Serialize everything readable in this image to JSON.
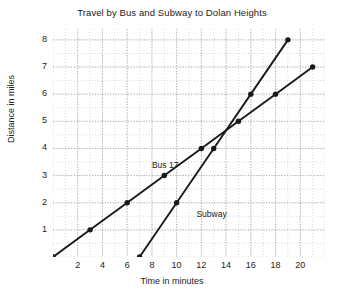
{
  "chart_data": {
    "type": "line",
    "title": "Travel by Bus and Subway to Dolan Heights",
    "xlabel": "Time in minutes",
    "ylabel": "Distance in miles",
    "xlim": [
      0,
      22
    ],
    "ylim": [
      0,
      8.4
    ],
    "xticks": [
      2,
      4,
      6,
      8,
      10,
      12,
      14,
      16,
      18,
      20
    ],
    "yticks": [
      1,
      2,
      3,
      4,
      5,
      6,
      7,
      8
    ],
    "grid": true,
    "grid_style": "dotted",
    "legend": "inline-annotations",
    "series": [
      {
        "name": "Bus 17",
        "color": "#1a1a1a",
        "marker": "filled-circle",
        "points": [
          {
            "x": 0,
            "y": 0
          },
          {
            "x": 3,
            "y": 1
          },
          {
            "x": 6,
            "y": 2
          },
          {
            "x": 9,
            "y": 3
          },
          {
            "x": 12,
            "y": 4
          },
          {
            "x": 15,
            "y": 5
          },
          {
            "x": 18,
            "y": 6
          },
          {
            "x": 21,
            "y": 7
          }
        ],
        "annotation": {
          "text": "Bus 17",
          "x": 8.0,
          "y": 3.35
        }
      },
      {
        "name": "Subway",
        "color": "#1a1a1a",
        "marker": "filled-circle",
        "points": [
          {
            "x": 7,
            "y": 0
          },
          {
            "x": 10,
            "y": 2
          },
          {
            "x": 13,
            "y": 4
          },
          {
            "x": 16,
            "y": 6
          },
          {
            "x": 19,
            "y": 8
          }
        ],
        "annotation": {
          "text": "Subway",
          "x": 11.6,
          "y": 1.55
        }
      }
    ]
  },
  "axis": {
    "xtick_labels": [
      "2",
      "4",
      "6",
      "8",
      "10",
      "12",
      "14",
      "16",
      "18",
      "20"
    ],
    "ytick_labels": [
      "1",
      "2",
      "3",
      "4",
      "5",
      "6",
      "7",
      "8"
    ]
  }
}
